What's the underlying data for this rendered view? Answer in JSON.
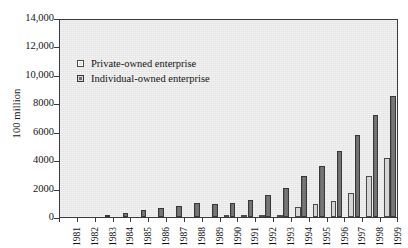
{
  "chart_data": {
    "type": "bar",
    "title": "",
    "subtitle": "",
    "xlabel": "",
    "ylabel": "100 million",
    "ylim": [
      0,
      14000
    ],
    "ytick_labels": [
      "14,000",
      "12,000",
      "10,000",
      "8000",
      "6000",
      "4000",
      "2000",
      "0"
    ],
    "ytick_values": [
      14000,
      12000,
      10000,
      8000,
      6000,
      4000,
      2000,
      0
    ],
    "grid": false,
    "legend_position": "upper-left-inside",
    "categories": [
      "1981",
      "1982",
      "1983",
      "1984",
      "1985",
      "1986",
      "1987",
      "1988",
      "1989",
      "1990",
      "1991",
      "1992",
      "1993",
      "1994",
      "1995",
      "1996",
      "1997",
      "1998",
      "1999"
    ],
    "series": [
      {
        "name": "Private-owned enterprise",
        "color": "#d6d6d6",
        "values": [
          0,
          0,
          0,
          0,
          0,
          0,
          0,
          0,
          0,
          50,
          60,
          100,
          150,
          700,
          900,
          1150,
          1700,
          2900,
          4150
        ]
      },
      {
        "name": "Individual-owned enterprise",
        "color": "#6e6e6e",
        "values": [
          0,
          0,
          150,
          300,
          460,
          600,
          780,
          1010,
          950,
          1020,
          1220,
          1520,
          2050,
          2900,
          3600,
          4620,
          5800,
          7200,
          8500
        ]
      }
    ]
  },
  "axes": {
    "y_title": "100 million",
    "y_ticks": [
      {
        "label": "14,000",
        "value": 14000
      },
      {
        "label": "12,000",
        "value": 12000
      },
      {
        "label": "10,000",
        "value": 10000
      },
      {
        "label": "8000",
        "value": 8000
      },
      {
        "label": "6000",
        "value": 6000
      },
      {
        "label": "4000",
        "value": 4000
      },
      {
        "label": "2000",
        "value": 2000
      },
      {
        "label": "0",
        "value": 0
      }
    ],
    "x_labels": [
      "1981",
      "1982",
      "1983",
      "1984",
      "1985",
      "1986",
      "1987",
      "1988",
      "1989",
      "1990",
      "1991",
      "1992",
      "1993",
      "1994",
      "1995",
      "1996",
      "1997",
      "1998",
      "1999"
    ]
  },
  "legend": {
    "items": [
      {
        "label": "Private-owned enterprise",
        "swatch": "light"
      },
      {
        "label": "Individual-owned enterprise",
        "swatch": "dark"
      }
    ]
  },
  "colors": {
    "plot_background": "#e8e8e8",
    "frame": "#3a3a3a",
    "private_owned": "#d6d6d6",
    "individual_owned": "#6e6e6e",
    "text": "#141414",
    "page_background": "#ffffff"
  }
}
